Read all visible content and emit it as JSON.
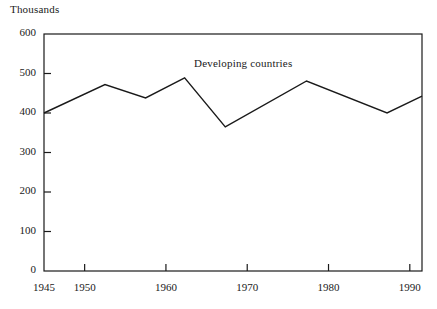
{
  "chart_data": {
    "type": "line",
    "title": "",
    "unit_label": "Thousands",
    "xlabel": "",
    "ylabel": "",
    "xlim": [
      1945,
      1991.5
    ],
    "ylim": [
      0,
      600
    ],
    "grid": false,
    "legend_position": "inline-annotation",
    "yticks": [
      0,
      100,
      200,
      300,
      400,
      500,
      600
    ],
    "ytick_labels": [
      "0",
      "100",
      "200",
      "300",
      "400",
      "500",
      "600"
    ],
    "xticks": [
      1945,
      1950,
      1960,
      1970,
      1980,
      1990
    ],
    "xtick_labels": [
      "1945",
      "1950",
      "1960",
      "1970",
      "1980",
      "1990"
    ],
    "series": [
      {
        "name": "Developing countries",
        "annotation": "Developing countries",
        "color": "#1a1a1a",
        "x": [
          1945,
          1952.5,
          1957.5,
          1962.3,
          1967.3,
          1977.3,
          1987.2,
          1991.5
        ],
        "values": [
          400,
          472,
          438,
          489,
          365,
          481,
          400,
          443
        ]
      }
    ]
  },
  "axes": {
    "frame_color": "#1a1a1a",
    "line_color": "#1a1a1a"
  }
}
